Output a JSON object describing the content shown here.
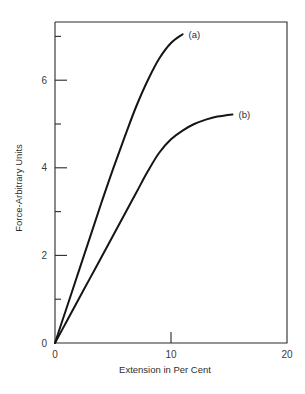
{
  "chart_data": {
    "type": "line",
    "title": "",
    "xlabel": "Extension in Per Cent",
    "ylabel": "Force-Arbitrary Units",
    "xlim": [
      0,
      20
    ],
    "ylim": [
      0,
      7.3
    ],
    "grid": false,
    "legend": "inline labels at curve ends",
    "x_ticks": [
      0,
      10,
      20
    ],
    "x_tick_labels": [
      "0",
      "10",
      "20"
    ],
    "y_ticks_major": [
      0,
      2,
      4,
      6
    ],
    "y_tick_labels": [
      "0",
      "2",
      "4",
      "6"
    ],
    "y_ticks_minor": [
      1,
      3,
      5,
      7
    ],
    "series": [
      {
        "name": "(a)",
        "x": [
          0,
          1,
          2,
          3,
          4,
          5,
          6,
          7,
          8,
          9,
          10,
          11
        ],
        "y": [
          0,
          0.8,
          1.6,
          2.4,
          3.2,
          3.97,
          4.7,
          5.4,
          6.0,
          6.5,
          6.85,
          7.05
        ]
      },
      {
        "name": "(b)",
        "x": [
          0,
          1,
          2,
          3,
          4,
          5,
          6,
          7,
          8,
          9,
          10,
          11,
          12,
          13,
          14,
          15.3
        ],
        "y": [
          0,
          0.49,
          0.98,
          1.47,
          1.96,
          2.45,
          2.94,
          3.43,
          3.92,
          4.35,
          4.65,
          4.85,
          5.0,
          5.1,
          5.17,
          5.22
        ]
      }
    ]
  }
}
